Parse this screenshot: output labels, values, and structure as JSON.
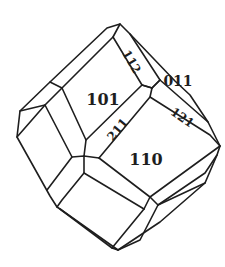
{
  "figure": {
    "type": "crystal-habit-drawing",
    "line_color": "#1e1e1e",
    "background": "#ffffff",
    "faces": [
      {
        "id": "f101",
        "label": "101",
        "x": 103,
        "y": 100,
        "size": 16,
        "rotate": 0
      },
      {
        "id": "f110",
        "label": "110",
        "x": 146,
        "y": 160,
        "size": 16,
        "rotate": 0
      },
      {
        "id": "f211",
        "label": "211",
        "x": 118,
        "y": 130,
        "size": 12,
        "rotate": -38
      },
      {
        "id": "f112",
        "label": "112",
        "x": 131,
        "y": 66,
        "size": 12,
        "rotate": 60
      },
      {
        "id": "f011",
        "label": "011",
        "x": 176,
        "y": 84,
        "size": 14,
        "rotate": 0
      },
      {
        "id": "f121",
        "label": "121",
        "x": 182,
        "y": 119,
        "size": 12,
        "rotate": 35
      }
    ]
  }
}
